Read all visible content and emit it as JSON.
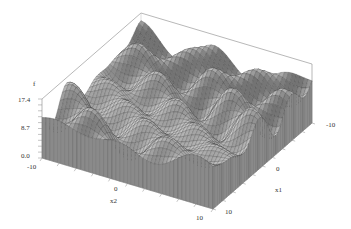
{
  "chart_data": {
    "type": "surface",
    "title": "",
    "function_shape": "multimodal oscillating surface (Griewank-like) over square domain",
    "x_axis": {
      "label": "x2",
      "range": [
        -10,
        10
      ],
      "ticks": [
        "-10",
        "0",
        "10"
      ]
    },
    "y_axis": {
      "label": "x1",
      "range": [
        -10,
        10
      ],
      "ticks": [
        "-10",
        "0",
        "10"
      ]
    },
    "z_axis": {
      "label": "f",
      "range": [
        0.0,
        17.4
      ],
      "ticks": [
        "0.0",
        "8.7",
        "17.4"
      ]
    },
    "grid": false,
    "legend": "none",
    "box": true,
    "render": "wireframe mesh, gray shading",
    "colors": {
      "mesh_line": "#3a3a3a",
      "face_light": "#f2f2f2",
      "face_dark": "#9a9a9a",
      "axis": "#888888",
      "text": "#333333"
    }
  },
  "labels": {
    "z_title": "f",
    "z_top": "17.4",
    "z_mid": "8.7",
    "z_bot": "0.0",
    "x2_min": "-10",
    "x2_mid": "0",
    "x2_max": "10",
    "x2_title": "x2",
    "x1_min": "-10",
    "x1_mid": "0",
    "x1_max": "10",
    "x1_title": "x1"
  }
}
